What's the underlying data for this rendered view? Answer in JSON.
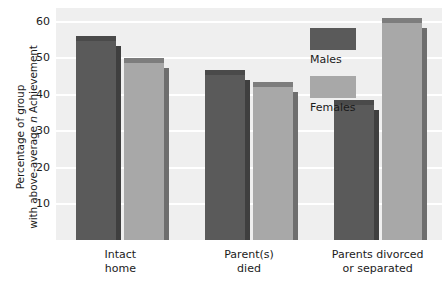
{
  "chart_data": {
    "type": "bar",
    "title": "",
    "xlabel": "",
    "ylabel_line1": "Percentage of group",
    "ylabel_line2_pre": "with above-average ",
    "ylabel_line2_ital": "n",
    "ylabel_line2_post": " Achievement",
    "ylabel": "Percentage of group with above-average n Achievement",
    "categories": [
      "Intact\nhome",
      "Parent(s)\ndied",
      "Parents divorced\nor separated"
    ],
    "category_lines": [
      [
        "Intact",
        "home"
      ],
      [
        "Parent(s)",
        "died"
      ],
      [
        "Parents divorced",
        "or separated"
      ]
    ],
    "series": [
      {
        "name": "Males",
        "color": "#5a5a5a",
        "values": [
          54.5,
          45.3,
          37.0
        ]
      },
      {
        "name": "Females",
        "color": "#a8a8a8",
        "values": [
          48.5,
          42.0,
          59.5
        ]
      }
    ],
    "ylim": [
      0,
      63.5
    ],
    "yticks": [
      10,
      20,
      30,
      40,
      50,
      60
    ],
    "ytick_labels": [
      "10",
      "20",
      "30",
      "40",
      "50",
      "60"
    ],
    "grid": true,
    "grid_color": "#ffffff",
    "legend_position": "top-right-inside",
    "plot_background": "#efefef",
    "page_background": "#ffffff"
  },
  "legend": {
    "entries": [
      {
        "label": "Males",
        "swatch": "males"
      },
      {
        "label": "Females",
        "swatch": "females"
      }
    ]
  }
}
